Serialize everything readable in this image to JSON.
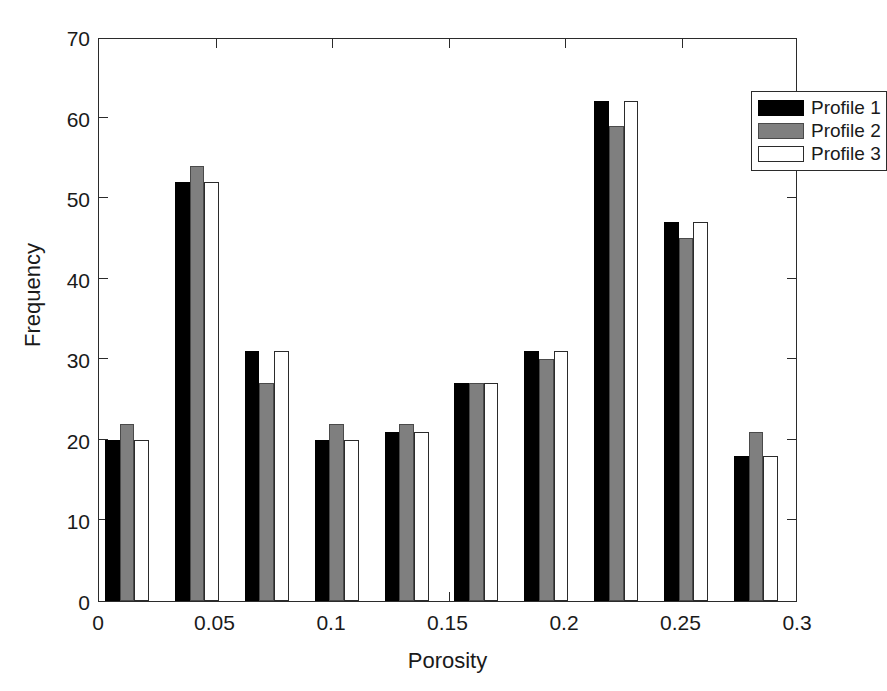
{
  "chart_data": {
    "type": "bar",
    "title": "",
    "xlabel": "Porosity",
    "ylabel": "Frequency",
    "xlim": [
      0,
      0.3
    ],
    "ylim": [
      0,
      70
    ],
    "xticks": [
      0,
      0.05,
      0.1,
      0.15,
      0.2,
      0.25,
      0.3
    ],
    "xtick_labels": [
      "0",
      "0.05",
      "0.1",
      "0.15",
      "0.2",
      "0.25",
      "0.3"
    ],
    "yticks": [
      0,
      10,
      20,
      30,
      40,
      50,
      60,
      70
    ],
    "ytick_labels": [
      "0",
      "10",
      "20",
      "30",
      "40",
      "50",
      "60",
      "70"
    ],
    "grid": false,
    "legend_position": "top-right",
    "bin_centers": [
      0.012,
      0.042,
      0.072,
      0.102,
      0.132,
      0.162,
      0.192,
      0.222,
      0.252,
      0.282
    ],
    "categories": [
      "0.012",
      "0.042",
      "0.072",
      "0.102",
      "0.132",
      "0.162",
      "0.192",
      "0.222",
      "0.252",
      "0.282"
    ],
    "series": [
      {
        "name": "Profile 1",
        "color": "#000000",
        "values": [
          20,
          52,
          31,
          20,
          21,
          27,
          31,
          62,
          47,
          18
        ]
      },
      {
        "name": "Profile 2",
        "color": "#7f7f7f",
        "values": [
          22,
          54,
          27,
          22,
          22,
          27,
          30,
          59,
          45,
          21
        ]
      },
      {
        "name": "Profile 3",
        "color": "#ffffff",
        "values": [
          20,
          52,
          31,
          20,
          21,
          27,
          31,
          62,
          47,
          18
        ]
      }
    ]
  },
  "legend": {
    "entries": [
      {
        "label": "Profile 1"
      },
      {
        "label": "Profile 2"
      },
      {
        "label": "Profile 3"
      }
    ]
  },
  "axes": {
    "x_title": "Porosity",
    "y_title": "Frequency"
  }
}
